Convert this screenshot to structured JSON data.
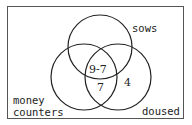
{
  "diagram": {
    "type": "venn",
    "sets": [
      {
        "name": "sows",
        "label": "sows"
      },
      {
        "name": "money_counters",
        "label_line1": "money",
        "label_line2": "counters"
      },
      {
        "name": "doused",
        "label": "doused"
      }
    ],
    "regions": {
      "sows_and_money_not_only": "9-7",
      "all_three": "7",
      "doused_only": "4"
    },
    "stroke_color": "#222222",
    "frame_color": "#555555"
  }
}
